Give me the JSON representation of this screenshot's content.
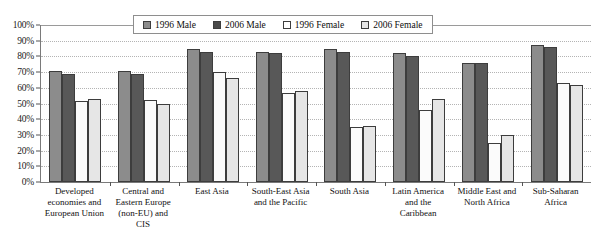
{
  "chart_data": {
    "type": "bar",
    "title": "",
    "xlabel": "",
    "ylabel": "",
    "ylim": [
      0,
      100
    ],
    "grid": true,
    "legend_position": "top-center",
    "tick_labels": [
      "0%",
      "10%",
      "20%",
      "30%",
      "40%",
      "50%",
      "60%",
      "70%",
      "80%",
      "90%",
      "100%"
    ],
    "tick_values": [
      0,
      10,
      20,
      30,
      40,
      50,
      60,
      70,
      80,
      90,
      100
    ],
    "categories": [
      "Developed economies and European Union",
      "Central and Eastern Europe (non-EU) and CIS",
      "East Asia",
      "South-East Asia and the Pacific",
      "South Asia",
      "Latin America and the Caribbean",
      "Middle East and North Africa",
      "Sub-Saharan Africa"
    ],
    "series": [
      {
        "name": "1996 Male",
        "color": "#8c8c8c",
        "values": [
          71,
          71,
          85,
          83,
          85,
          82,
          76,
          87
        ]
      },
      {
        "name": "2006 Male",
        "color": "#585858",
        "values": [
          69,
          69,
          83,
          82,
          83,
          80,
          76,
          86
        ]
      },
      {
        "name": "1996 Female",
        "color": "#fbfbfb",
        "values": [
          51.5,
          52,
          70,
          57,
          35,
          46,
          25,
          63
        ]
      },
      {
        "name": "2006 Female",
        "color": "#e6e6e6",
        "values": [
          53,
          50,
          66,
          58,
          35.5,
          53,
          30,
          62
        ]
      }
    ]
  }
}
